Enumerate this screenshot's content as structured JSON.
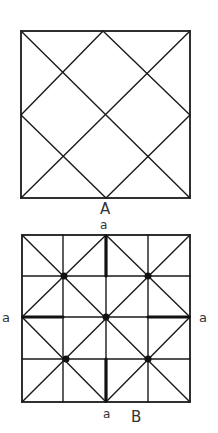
{
  "figures": [
    {
      "id": "A",
      "caption": "A",
      "description": "Square with both diagonals and a diamond connecting side midpoints",
      "square": {
        "x": 21,
        "y": 31,
        "w": 169,
        "h": 167
      }
    },
    {
      "id": "B",
      "caption": "B",
      "description": "Square with 4x4 grid, both diagonals, diamond through side midpoints, five dots at intersections, and four thickened segments",
      "square": {
        "x": 22,
        "y": 235,
        "w": 168,
        "h": 167
      },
      "side_labels": {
        "top": "a",
        "left": "a",
        "right": "a",
        "bottom": "a"
      },
      "dots": 5
    }
  ],
  "colors": {
    "line": "#1a1a1a",
    "background": "#ffffff"
  }
}
